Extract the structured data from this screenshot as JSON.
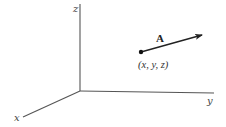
{
  "figure": {
    "type": "3d-coordinate-system-with-vector",
    "axes": {
      "z": {
        "label": "z"
      },
      "y": {
        "label": "y"
      },
      "x": {
        "label": "x"
      }
    },
    "vector": {
      "label": "A",
      "tail_point_label": "(x, y, z)"
    },
    "colors": {
      "background": "#ffffff",
      "axis": "#555555",
      "vector": "#222222",
      "text": "#333333"
    }
  }
}
